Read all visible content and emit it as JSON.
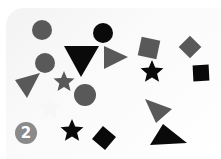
{
  "scene": {
    "description": "Scattered geometric shapes (circles, triangles, stars, squares) in gray and black on a light background",
    "colors": {
      "gray": "#595959",
      "black": "#0a0a0a",
      "faint_white": "#f7f7f7",
      "badge": "#8a8a8a",
      "background": "#fafafa"
    },
    "badge": {
      "label": "2",
      "x": 15,
      "y": 122
    },
    "shapes": [
      {
        "type": "circle",
        "color": "gray",
        "cx": 42,
        "cy": 30,
        "r": 10
      },
      {
        "type": "circle",
        "color": "black",
        "cx": 103,
        "cy": 33,
        "r": 10
      },
      {
        "type": "triangle",
        "color": "black",
        "points": "64,46 99,46 81,77"
      },
      {
        "type": "triangle",
        "color": "gray",
        "points": "104,46 104,69 128,57"
      },
      {
        "type": "circle",
        "color": "gray",
        "cx": 45,
        "cy": 63,
        "r": 10
      },
      {
        "type": "triangle",
        "color": "gray",
        "points": "15,80 40,73 27,98"
      },
      {
        "type": "star",
        "color": "gray",
        "cx": 64,
        "cy": 82,
        "r": 11
      },
      {
        "type": "circle",
        "color": "gray",
        "cx": 85,
        "cy": 95,
        "r": 11
      },
      {
        "type": "star",
        "color": "faint_white",
        "cx": 50,
        "cy": 108,
        "r": 12
      },
      {
        "type": "square",
        "color": "gray",
        "cx": 149,
        "cy": 48,
        "size": 19,
        "rotate": 12
      },
      {
        "type": "square",
        "color": "gray",
        "cx": 190,
        "cy": 47,
        "size": 16,
        "rotate": 45
      },
      {
        "type": "star",
        "color": "black",
        "cx": 152,
        "cy": 72,
        "r": 12
      },
      {
        "type": "square",
        "color": "black",
        "cx": 201,
        "cy": 73,
        "size": 16,
        "rotate": -3
      },
      {
        "type": "triangle",
        "color": "gray",
        "points": "145,99 172,109 156,123"
      },
      {
        "type": "triangle",
        "color": "black",
        "points": "150,145 163,124 187,143"
      },
      {
        "type": "star",
        "color": "black",
        "cx": 72,
        "cy": 131,
        "r": 12
      },
      {
        "type": "square",
        "color": "black",
        "cx": 104,
        "cy": 138,
        "size": 17,
        "rotate": 40
      }
    ]
  }
}
